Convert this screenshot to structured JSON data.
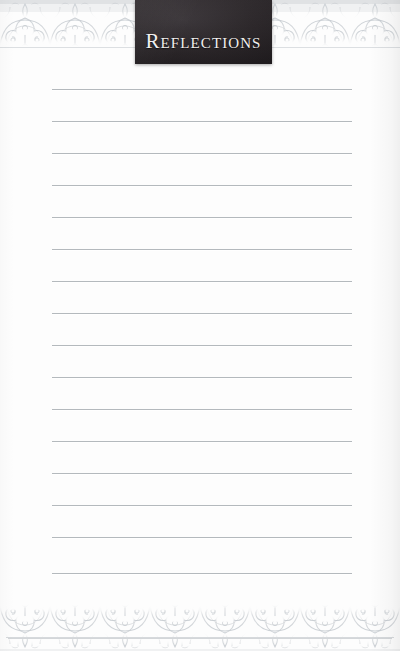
{
  "page": {
    "name": "reflections-journal-page",
    "width": 400,
    "height": 651,
    "background_color": "#fdfdfd"
  },
  "banner": {
    "title": "Reflections",
    "background_color": "#2b2629",
    "text_color": "#f2f0ef",
    "left": 135,
    "top": 0,
    "width": 137,
    "height": 64
  },
  "ornament": {
    "style_name": "arabesque-damask-scroll",
    "color": "#d9dcdf",
    "top_band_height": 60,
    "bottom_band_height": 74
  },
  "rules": {
    "count": 16,
    "first_y": 89,
    "spacing": 32,
    "left": 52,
    "right": 352,
    "color": "#b4b9bd",
    "positions": [
      89,
      121,
      153,
      185,
      217,
      249,
      281,
      313,
      345,
      377,
      409,
      441,
      473,
      505,
      537,
      573
    ]
  },
  "base_rule": {
    "y": 638,
    "color": "#d3d6d9"
  }
}
